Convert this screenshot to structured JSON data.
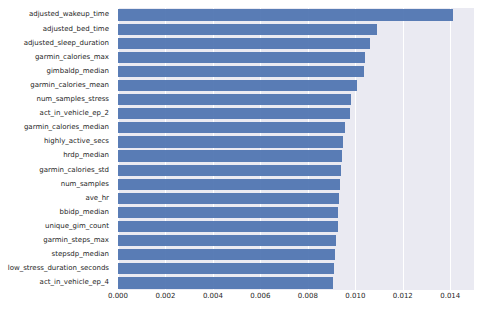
{
  "chart_data": {
    "type": "bar",
    "orientation": "horizontal",
    "title": "",
    "xlabel": "",
    "ylabel": "",
    "xlim": [
      0.0,
      0.015
    ],
    "xticks": [
      0.0,
      0.002,
      0.004,
      0.006,
      0.008,
      0.01,
      0.012,
      0.014
    ],
    "xticklabels": [
      "0.000",
      "0.002",
      "0.004",
      "0.006",
      "0.008",
      "0.010",
      "0.012",
      "0.014"
    ],
    "grid": "vertical-white-gridlines",
    "legend": "none",
    "bar_color": "#4c72b0",
    "plot_background": "#eaeaf2",
    "figure_background": "#ffffff",
    "categories": [
      "adjusted_wakeup_time",
      "adjusted_bed_time",
      "adjusted_sleep_duration",
      "garmin_calories_max",
      "gimbaldp_median",
      "garmin_calories_mean",
      "num_samples_stress",
      "act_in_vehicle_ep_2",
      "garmin_calories_median",
      "highly_active_secs",
      "hrdp_median",
      "garmin_calories_std",
      "num_samples",
      "ave_hr",
      "bbidp_median",
      "unique_gim_count",
      "garmin_steps_max",
      "stepsdp_median",
      "low_stress_duration_seconds",
      "act_in_vehicle_ep_4"
    ],
    "values": [
      0.0141,
      0.01093,
      0.01063,
      0.0104,
      0.01037,
      0.01008,
      0.0098,
      0.00978,
      0.00958,
      0.00949,
      0.00945,
      0.00941,
      0.00936,
      0.00932,
      0.00929,
      0.00925,
      0.0092,
      0.00916,
      0.00912,
      0.00905
    ]
  }
}
